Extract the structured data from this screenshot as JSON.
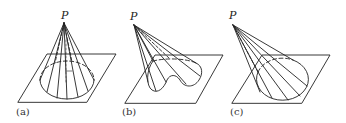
{
  "figure": {
    "panels": [
      {
        "id": "a",
        "caption": "(a)",
        "apex_label": "P",
        "base_shape": "ellipse (circular base on plane)",
        "description": "Cone with apex P over a plane; circular directrix lies in plane"
      },
      {
        "id": "b",
        "caption": "(b)",
        "apex_label": "P",
        "base_shape": "irregular closed curve (kidney/heart-like)",
        "description": "Generalized cone from P over an irregular closed curve in the plane"
      },
      {
        "id": "c",
        "caption": "(c)",
        "apex_label": "P",
        "base_shape": "ellipse (oblique cone)",
        "description": "Oblique cone with apex P offset to the left over an elliptical base"
      }
    ],
    "colors": {
      "line": "#222222",
      "background": "#ffffff"
    }
  }
}
